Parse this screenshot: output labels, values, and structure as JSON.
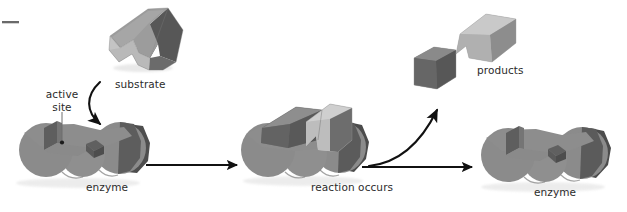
{
  "figure": {
    "type": "diagram",
    "background_color": "#ffffff",
    "stage_count": 3
  },
  "labels": {
    "active_site_line1": "active",
    "active_site_line2": "site",
    "substrate": "substrate",
    "enzyme_left": "enzyme",
    "reaction_occurs": "reaction occurs",
    "products": "products",
    "enzyme_right": "enzyme"
  },
  "colors": {
    "enzyme_body": "#8c8c8c",
    "enzyme_shadow": "#6e6e6e",
    "enzyme_dark_end": "#4f4f4f",
    "notch_dark": "#5a5a5a",
    "substrate_top": "#9a9a9a",
    "substrate_light": "#c9c9c9",
    "substrate_dark": "#5c5c5c",
    "product_cube": "#6a6a6a",
    "product_wedge": "#b9b9b9",
    "arrow": "#111111",
    "text": "#2b2b2b"
  },
  "stages": [
    {
      "name": "stage-1-substrate-and-enzyme",
      "caption": "enzyme",
      "annotation": "active site",
      "objects": [
        "substrate",
        "enzyme",
        "curved-binding-arrow",
        "active-site-pointer"
      ]
    },
    {
      "name": "stage-2-reaction",
      "caption": "reaction occurs",
      "objects": [
        "enzyme-substrate-complex"
      ]
    },
    {
      "name": "stage-3-products-and-enzyme",
      "caption": "enzyme",
      "annotation": "products",
      "objects": [
        "product-cube",
        "product-wedge",
        "enzyme",
        "curved-release-arrow"
      ]
    }
  ],
  "arrows": [
    {
      "name": "binding-arrow",
      "kind": "curved",
      "from": "substrate",
      "to": "active-site"
    },
    {
      "name": "stage1-to-stage2-arrow",
      "kind": "straight-horizontal",
      "direction": "right"
    },
    {
      "name": "stage2-to-stage3-arrow",
      "kind": "straight-horizontal",
      "direction": "right"
    },
    {
      "name": "product-release-arrow",
      "kind": "curved",
      "from": "complex",
      "to": "products"
    }
  ],
  "marks": [
    {
      "name": "top-left-dash",
      "kind": "short-horizontal-rule"
    }
  ]
}
